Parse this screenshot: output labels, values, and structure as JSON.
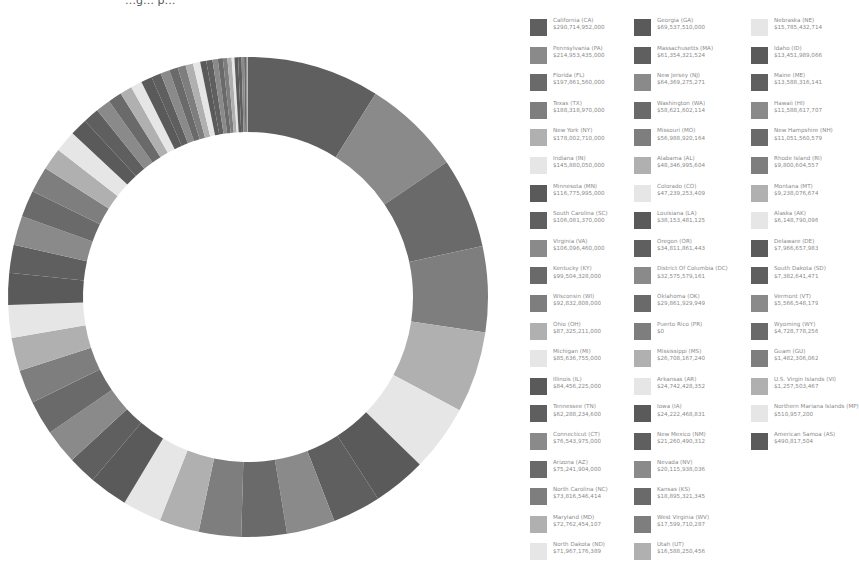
{
  "header": {
    "clipped_title": "…g… p…"
  },
  "palette": [
    "#5f5f5f",
    "#8a8a8a",
    "#6a6a6a",
    "#7e7e7e",
    "#b0b0b0",
    "#e6e6e6",
    "#5a5a5a"
  ],
  "chart_data": {
    "type": "pie",
    "subtype": "donut",
    "title": "",
    "legend_position": "right",
    "start_angle_deg": 0,
    "direction": "clockwise",
    "categories": [
      "California (CA)",
      "Pennsylvania (PA)",
      "Florida (FL)",
      "Texas (TX)",
      "New York (NY)",
      "Indiana (IN)",
      "Minnesota (MN)",
      "South Carolina (SC)",
      "Virginia (VA)",
      "Kentucky (KY)",
      "Wisconsin (WI)",
      "Ohio (OH)",
      "Michigan (MI)",
      "Illinois (IL)",
      "Tennessee (TN)",
      "Connecticut (CT)",
      "Arizona (AZ)",
      "North Carolina (NC)",
      "Maryland (MD)",
      "North Dakota (ND)",
      "Georgia (GA)",
      "Massachusetts (MA)",
      "New Jersey (NJ)",
      "Washington (WA)",
      "Missouri (MO)",
      "Alabama (AL)",
      "Colorado (CO)",
      "Louisiana (LA)",
      "Oregon (OR)",
      "District Of Columbia (DC)",
      "Oklahoma (OK)",
      "Puerto Rico (PR)",
      "Mississippi (MS)",
      "Arkansas (AR)",
      "Iowa (IA)",
      "New Mexico (NM)",
      "Nevada (NV)",
      "Kansas (KS)",
      "West Virginia (WV)",
      "Utah (UT)",
      "Nebraska (NE)",
      "Idaho (ID)",
      "Maine (ME)",
      "Hawaii (HI)",
      "New Hampshire (NH)",
      "Rhode Island (RI)",
      "Montana (MT)",
      "Alaska (AK)",
      "Delaware (DE)",
      "South Dakota (SD)",
      "Vermont (VT)",
      "Wyoming (WY)",
      "Guam (GU)",
      "U.S. Virgin Islands (VI)",
      "Northern Mariana Islands (MP)",
      "American Samoa (AS)"
    ],
    "values": [
      290714952000,
      214953435000,
      197861560000,
      188318970000,
      178002710000,
      145880050000,
      116775995000,
      106081370000,
      106096460000,
      99504328000,
      92832808000,
      87325211000,
      85636755000,
      84456225000,
      62288234600,
      76543975000,
      75241904000,
      73816546414,
      72762454107,
      71967176389,
      69537510000,
      61354321524,
      64369275271,
      58621602114,
      56988920164,
      48346995604,
      47239253409,
      38153481125,
      34811861443,
      32575579161,
      29861929949,
      0,
      26708167240,
      24742428352,
      24222468831,
      21260490312,
      20115938036,
      18895321345,
      17599710287,
      16588250456,
      15785432714,
      13451989066,
      13588316141,
      11588617707,
      11051560579,
      9800604557,
      9238076674,
      6148790096,
      7966657983,
      7382641471,
      5566548179,
      4728778256,
      1482306062,
      1257503467,
      510957200,
      490817504
    ],
    "value_labels": [
      "$290,714,952,000",
      "$214,953,435,000",
      "$197,861,560,000",
      "$188,318,970,000",
      "$178,002,710,000",
      "$145,880,050,000",
      "$116,775,995,000",
      "$106,081,370,000",
      "$106,096,460,000",
      "$99,504,328,000",
      "$92,832,808,000",
      "$87,325,211,000",
      "$85,636,755,000",
      "$84,456,225,000",
      "$62,288,234,600",
      "$76,543,975,000",
      "$75,241,904,000",
      "$73,816,546,414",
      "$72,762,454,107",
      "$71,967,176,389",
      "$69,537,510,000",
      "$61,354,321,524",
      "$64,369,275,271",
      "$58,621,602,114",
      "$56,988,920,164",
      "$48,346,995,604",
      "$47,239,253,409",
      "$38,153,481,125",
      "$34,811,861,443",
      "$32,575,579,161",
      "$29,861,929,949",
      "$0",
      "$26,708,167,240",
      "$24,742,428,352",
      "$24,222,468,831",
      "$21,260,490,312",
      "$20,115,938,036",
      "$18,895,321,345",
      "$17,599,710,287",
      "$16,588,250,456",
      "$15,785,432,714",
      "$13,451,989,066",
      "$13,588,316,141",
      "$11,588,617,707",
      "$11,051,560,579",
      "$9,800,604,557",
      "$9,238,076,674",
      "$6,148,790,096",
      "$7,966,657,983",
      "$7,382,641,471",
      "$5,566,548,179",
      "$4,728,778,256",
      "$1,482,306,062",
      "$1,257,503,467",
      "$510,957,200",
      "$490,817,504"
    ]
  },
  "legend": {
    "items": [
      {
        "name": "California (CA)",
        "value": "$290,714,952,000"
      },
      {
        "name": "Pennsylvania (PA)",
        "value": "$214,953,435,000"
      },
      {
        "name": "Florida (FL)",
        "value": "$197,861,560,000"
      },
      {
        "name": "Texas (TX)",
        "value": "$188,318,970,000"
      },
      {
        "name": "New York (NY)",
        "value": "$178,002,710,000"
      },
      {
        "name": "Indiana (IN)",
        "value": "$145,880,050,000"
      },
      {
        "name": "Minnesota (MN)",
        "value": "$116,775,995,000"
      },
      {
        "name": "South Carolina (SC)",
        "value": "$106,081,370,000"
      },
      {
        "name": "Virginia (VA)",
        "value": "$106,096,460,000"
      },
      {
        "name": "Kentucky (KY)",
        "value": "$99,504,328,000"
      },
      {
        "name": "Wisconsin (WI)",
        "value": "$92,832,808,000"
      },
      {
        "name": "Ohio (OH)",
        "value": "$87,325,211,000"
      },
      {
        "name": "Michigan (MI)",
        "value": "$85,636,755,000"
      },
      {
        "name": "Illinois (IL)",
        "value": "$84,456,225,000"
      },
      {
        "name": "Tennessee (TN)",
        "value": "$62,288,234,600"
      },
      {
        "name": "Connecticut (CT)",
        "value": "$76,543,975,000"
      },
      {
        "name": "Arizona (AZ)",
        "value": "$75,241,904,000"
      },
      {
        "name": "North Carolina (NC)",
        "value": "$73,816,546,414"
      },
      {
        "name": "Maryland (MD)",
        "value": "$72,762,454,107"
      },
      {
        "name": "North Dakota (ND)",
        "value": "$71,967,176,389"
      },
      {
        "name": "Georgia (GA)",
        "value": "$69,537,510,000"
      },
      {
        "name": "Massachusetts (MA)",
        "value": "$61,354,321,524"
      },
      {
        "name": "New Jersey (NJ)",
        "value": "$64,369,275,271"
      },
      {
        "name": "Washington (WA)",
        "value": "$58,621,602,114"
      },
      {
        "name": "Missouri (MO)",
        "value": "$56,988,920,164"
      },
      {
        "name": "Alabama (AL)",
        "value": "$48,346,995,604"
      },
      {
        "name": "Colorado (CO)",
        "value": "$47,239,253,409"
      },
      {
        "name": "Louisiana (LA)",
        "value": "$38,153,481,125"
      },
      {
        "name": "Oregon (OR)",
        "value": "$34,811,861,443"
      },
      {
        "name": "District Of Columbia (DC)",
        "value": "$32,575,579,161"
      },
      {
        "name": "Oklahoma (OK)",
        "value": "$29,861,929,949"
      },
      {
        "name": "Puerto Rico (PR)",
        "value": "$0"
      },
      {
        "name": "Mississippi (MS)",
        "value": "$26,708,167,240"
      },
      {
        "name": "Arkansas (AR)",
        "value": "$24,742,428,352"
      },
      {
        "name": "Iowa (IA)",
        "value": "$24,222,468,831"
      },
      {
        "name": "New Mexico (NM)",
        "value": "$21,260,490,312"
      },
      {
        "name": "Nevada (NV)",
        "value": "$20,115,938,036"
      },
      {
        "name": "Kansas (KS)",
        "value": "$18,895,321,345"
      },
      {
        "name": "West Virginia (WV)",
        "value": "$17,599,710,287"
      },
      {
        "name": "Utah (UT)",
        "value": "$16,588,250,456"
      },
      {
        "name": "Nebraska (NE)",
        "value": "$15,785,432,714"
      },
      {
        "name": "Idaho (ID)",
        "value": "$13,451,989,066"
      },
      {
        "name": "Maine (ME)",
        "value": "$13,588,316,141"
      },
      {
        "name": "Hawaii (HI)",
        "value": "$11,588,617,707"
      },
      {
        "name": "New Hampshire (NH)",
        "value": "$11,051,560,579"
      },
      {
        "name": "Rhode Island (RI)",
        "value": "$9,800,604,557"
      },
      {
        "name": "Montana (MT)",
        "value": "$9,238,076,674"
      },
      {
        "name": "Alaska (AK)",
        "value": "$6,148,790,096"
      },
      {
        "name": "Delaware (DE)",
        "value": "$7,966,657,983"
      },
      {
        "name": "South Dakota (SD)",
        "value": "$7,382,641,471"
      },
      {
        "name": "Vermont (VT)",
        "value": "$5,566,548,179"
      },
      {
        "name": "Wyoming (WY)",
        "value": "$4,728,778,256"
      },
      {
        "name": "Guam (GU)",
        "value": "$1,482,306,062"
      },
      {
        "name": "U.S. Virgin Islands (VI)",
        "value": "$1,257,503,467"
      },
      {
        "name": "Northern Mariana Islands (MP)",
        "value": "$510,957,200"
      },
      {
        "name": "American Samoa (AS)",
        "value": "$490,817,504"
      }
    ]
  }
}
